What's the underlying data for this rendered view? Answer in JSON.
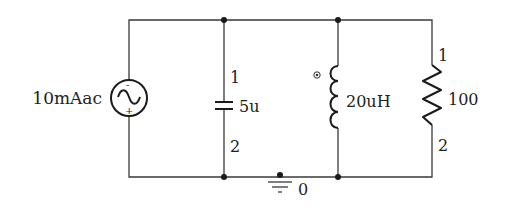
{
  "circuit": {
    "source": {
      "type": "ac-current-source",
      "label": "10mAac",
      "minus": "-",
      "plus": "+"
    },
    "capacitor": {
      "label": "5u",
      "pin1": "1",
      "pin2": "2"
    },
    "inductor": {
      "label": "20uH"
    },
    "resistor": {
      "label": "100",
      "pin1": "1",
      "pin2": "2"
    },
    "ground": {
      "label": "0"
    }
  }
}
